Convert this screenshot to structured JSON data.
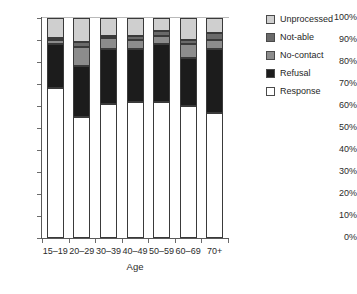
{
  "chart_data": {
    "type": "bar",
    "subtype": "stacked-percentage",
    "title": "",
    "xlabel": "Age",
    "ylabel": "",
    "ylim": [
      0,
      100
    ],
    "ytick_labels": [
      "100%",
      "90%",
      "80%",
      "70%",
      "60%",
      "50%",
      "40%",
      "30%",
      "20%",
      "10%",
      "0%"
    ],
    "ytick_values": [
      100,
      90,
      80,
      70,
      60,
      50,
      40,
      30,
      20,
      10,
      0
    ],
    "grid": false,
    "legend_position": "right",
    "categories": [
      "15–19",
      "20–29",
      "30–39",
      "40–49",
      "50–59",
      "60–69",
      "70+"
    ],
    "series": [
      {
        "name": "Response",
        "values": [
          68,
          55,
          61,
          62,
          62,
          60,
          57
        ]
      },
      {
        "name": "Refusal",
        "values": [
          20,
          23,
          25,
          24,
          26,
          22,
          29
        ]
      },
      {
        "name": "No-contact",
        "values": [
          2,
          9,
          5,
          4,
          4,
          6,
          4
        ]
      },
      {
        "name": "Not-able",
        "values": [
          1,
          2,
          1,
          2,
          2,
          2,
          3
        ]
      },
      {
        "name": "Unprocessed",
        "values": [
          9,
          11,
          8,
          8,
          6,
          10,
          7
        ]
      }
    ],
    "series_colors": {
      "Response": "#ffffff",
      "Refusal": "#1c1c1c",
      "No-contact": "#8c8c8c",
      "Not-able": "#6a6a6a",
      "Unprocessed": "#cfcfcf"
    },
    "annotations": []
  },
  "legend": {
    "items": [
      {
        "label": "Unprocessed",
        "swatch": "legend-swatch-unprocessed"
      },
      {
        "label": "Not-able",
        "swatch": "legend-swatch-not-able"
      },
      {
        "label": "No-contact",
        "swatch": "legend-swatch-no-contact"
      },
      {
        "label": "Refusal",
        "swatch": "legend-swatch-refusal"
      },
      {
        "label": "Response",
        "swatch": "legend-swatch-response"
      }
    ]
  },
  "axes": {
    "x_title": "Age",
    "x_labels": [
      "15–19",
      "20–29",
      "30–39",
      "40–49",
      "50–59",
      "60–69",
      "70+"
    ],
    "y_labels": [
      "100%",
      "90%",
      "80%",
      "70%",
      "60%",
      "50%",
      "40%",
      "30%",
      "20%",
      "10%",
      "0%"
    ]
  },
  "caption": {
    "text": ""
  }
}
